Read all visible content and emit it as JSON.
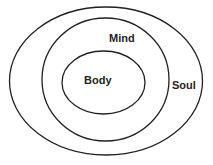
{
  "diagram": {
    "type": "nested-ellipses",
    "stroke_color": "#231f20",
    "layers": [
      {
        "label": "Soul",
        "position": "outer"
      },
      {
        "label": "Mind",
        "position": "middle"
      },
      {
        "label": "Body",
        "position": "inner"
      }
    ]
  }
}
